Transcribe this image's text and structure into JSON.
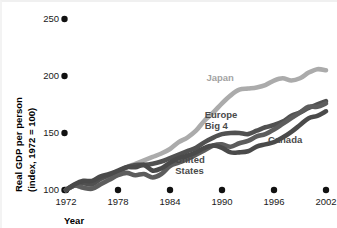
{
  "chart_data": {
    "type": "line",
    "title": "",
    "subtitle": "",
    "xlabel": "Year",
    "ylabel": "Real GDP per person\n(index, 1972 = 100)",
    "ylabel_line1": "Real GDP per person",
    "ylabel_line2": "(index, 1972 = 100)",
    "xlim": [
      1972,
      2002
    ],
    "ylim": [
      100,
      250
    ],
    "xticks": [
      1972,
      1978,
      1984,
      1990,
      1996,
      2002
    ],
    "xtick_labels": [
      "1972",
      "1978",
      "1984",
      "1990",
      "1996",
      "2002"
    ],
    "yticks": [
      100,
      150,
      200,
      250
    ],
    "ytick_labels": [
      "100",
      "150",
      "200",
      "250"
    ],
    "grid": false,
    "legend_position": "inline-labels",
    "tick_marker": "filled-circle",
    "x": [
      1972,
      1973,
      1974,
      1975,
      1976,
      1977,
      1978,
      1979,
      1980,
      1981,
      1982,
      1983,
      1984,
      1985,
      1986,
      1987,
      1988,
      1989,
      1990,
      1991,
      1992,
      1993,
      1994,
      1995,
      1996,
      1997,
      1998,
      1999,
      2000,
      2001,
      2002
    ],
    "series": [
      {
        "name": "Japan",
        "color": "#ababab",
        "label_x": 1988.2,
        "label_y": 196,
        "values": [
          100,
          104,
          102,
          104,
          107,
          111,
          115,
          120,
          123,
          126,
          129,
          132,
          136,
          142,
          146,
          152,
          161,
          168,
          176,
          183,
          188,
          189,
          190,
          192,
          196,
          198,
          196,
          198,
          203,
          206,
          205
        ]
      },
      {
        "name": "Europe Big 4",
        "color": "#515151",
        "label_x": 1988.0,
        "label_y": 163,
        "label_line1": "Europe",
        "label_line2": "Big 4",
        "values": [
          100,
          104,
          106,
          105,
          110,
          113,
          116,
          120,
          122,
          122,
          123,
          125,
          128,
          131,
          134,
          137,
          142,
          146,
          149,
          150,
          150,
          149,
          152,
          155,
          157,
          160,
          165,
          168,
          172,
          175,
          178
        ]
      },
      {
        "name": "United States",
        "color": "#5d5d5d",
        "label_x": 1984.6,
        "label_y": 124,
        "label_line1": "United",
        "label_line2": "States",
        "values": [
          100,
          104,
          102,
          101,
          105,
          109,
          113,
          115,
          113,
          114,
          111,
          114,
          121,
          124,
          127,
          131,
          135,
          139,
          140,
          138,
          141,
          143,
          147,
          149,
          153,
          158,
          163,
          168,
          173,
          173,
          176
        ]
      },
      {
        "name": "Canada",
        "color": "#4a4a4a",
        "label_x": 1995.3,
        "label_y": 141,
        "values": [
          100,
          105,
          108,
          108,
          112,
          114,
          117,
          120,
          120,
          122,
          117,
          119,
          124,
          128,
          130,
          133,
          137,
          139,
          137,
          133,
          133,
          134,
          138,
          140,
          142,
          146,
          151,
          157,
          163,
          165,
          169
        ]
      }
    ]
  },
  "figure": {
    "background": "#ffffff",
    "text_color": "#1a1a1a"
  }
}
